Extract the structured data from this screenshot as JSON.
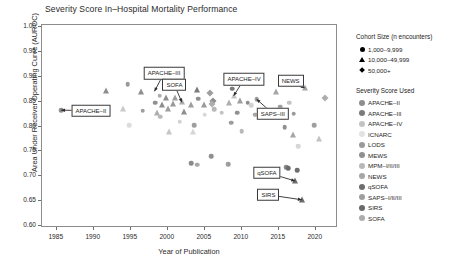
{
  "chart_data": {
    "type": "scatter",
    "title": "Severity Score In–Hospital Mortality Performance",
    "xlabel": "Year of Publication",
    "ylabel": "Area Under Receiver Operating Curve (AUROC)",
    "xlim": [
      1983,
      2023
    ],
    "ylim": [
      0.595,
      1.005
    ],
    "xticks": [
      1985,
      1990,
      1995,
      2000,
      2005,
      2010,
      2015,
      2020
    ],
    "yticks": [
      "1.00",
      "0.95",
      "0.90",
      "0.85",
      "0.80",
      "0.75",
      "0.70",
      "0.65",
      "0.60"
    ],
    "grid": false,
    "legend_position": "right",
    "size_legend": {
      "title": "Cohort Size (n encounters)",
      "entries": [
        {
          "shape": "circle",
          "label": "1,000–9,999"
        },
        {
          "shape": "triangle",
          "label": "10,000–49,999"
        },
        {
          "shape": "diamond",
          "label": "50,000+"
        }
      ]
    },
    "color_legend": {
      "title": "Severity Score Used",
      "entries": [
        {
          "label": "APACHE–II",
          "color": "#8e8e8e"
        },
        {
          "label": "APACHE–III",
          "color": "#7b7b7b"
        },
        {
          "label": "APACHE–IV",
          "color": "#c3c3c3"
        },
        {
          "label": "ICNARC",
          "color": "#e2e2e2"
        },
        {
          "label": "LODS",
          "color": "#9a9a9a"
        },
        {
          "label": "MEWS",
          "color": "#909090"
        },
        {
          "label": "MPM–I/II/III",
          "color": "#b8b8b8"
        },
        {
          "label": "NEWS",
          "color": "#a6a6a6"
        },
        {
          "label": "qSOFA",
          "color": "#6d6d6d"
        },
        {
          "label": "SAPS–I/II/III",
          "color": "#9e9e9e"
        },
        {
          "label": "SIRS",
          "color": "#6a6a6a"
        },
        {
          "label": "SOFA",
          "color": "#adadad"
        }
      ]
    },
    "annotations": [
      {
        "label": "APACHE–II",
        "box_x": 1989.6,
        "box_y": 0.832,
        "tip_x": 1985.6,
        "tip_y": 0.833
      },
      {
        "label": "APACHE–III",
        "box_x": 1999.5,
        "box_y": 0.908,
        "tip_x": 1998.2,
        "tip_y": 0.871
      },
      {
        "label": "APACHE–IV",
        "box_x": 2010.3,
        "box_y": 0.895,
        "tip_x": 2008.9,
        "tip_y": 0.862
      },
      {
        "label": "SOFA",
        "box_x": 2000.9,
        "box_y": 0.884,
        "tip_x": 2001.9,
        "tip_y": 0.849
      },
      {
        "label": "NEWS",
        "box_x": 2016.6,
        "box_y": 0.892,
        "tip_x": 2018.5,
        "tip_y": 0.878
      },
      {
        "label": "SAPS–III",
        "box_x": 2014.2,
        "box_y": 0.826,
        "tip_x": 2012.0,
        "tip_y": 0.855
      },
      {
        "label": "qSOFA",
        "box_x": 2013.4,
        "box_y": 0.707,
        "tip_x": 2017.2,
        "tip_y": 0.69
      },
      {
        "label": "SIRS",
        "box_x": 2013.6,
        "box_y": 0.662,
        "tip_x": 2018.1,
        "tip_y": 0.652
      }
    ],
    "points": [
      {
        "x": 1985.6,
        "y": 0.833,
        "score": "APACHE–II",
        "shape": "circle",
        "color": "#8e8e8e"
      },
      {
        "x": 1991.6,
        "y": 0.872,
        "score": "APACHE–II",
        "shape": "triangle",
        "color": "#8e8e8e"
      },
      {
        "x": 1994.6,
        "y": 0.885,
        "score": "APACHE–II",
        "shape": "circle",
        "color": "#9a9a9a"
      },
      {
        "x": 1996.4,
        "y": 0.869,
        "score": "APACHE–II",
        "shape": "triangle",
        "color": "#8e8e8e"
      },
      {
        "x": 1994.0,
        "y": 0.836,
        "score": "MPM–I/II/III",
        "shape": "triangle",
        "color": "#cacaca"
      },
      {
        "x": 1996.6,
        "y": 0.832,
        "score": "SAPS–I/II/III",
        "shape": "circle",
        "color": "#9e9e9e"
      },
      {
        "x": 1994.8,
        "y": 0.803,
        "score": "ICNARC",
        "shape": "circle",
        "color": "#dcdcdc"
      },
      {
        "x": 2000.2,
        "y": 0.878,
        "score": "APACHE–III",
        "shape": "triangle",
        "color": "#7b7b7b"
      },
      {
        "x": 1998.9,
        "y": 0.862,
        "score": "SOFA",
        "shape": "circle",
        "color": "#adadad"
      },
      {
        "x": 1999.8,
        "y": 0.857,
        "score": "APACHE–II",
        "shape": "triangle",
        "color": "#8e8e8e"
      },
      {
        "x": 2001.0,
        "y": 0.858,
        "score": "SAPS–I/II/III",
        "shape": "triangle",
        "color": "#9e9e9e"
      },
      {
        "x": 2001.9,
        "y": 0.849,
        "score": "SOFA",
        "shape": "triangle",
        "color": "#adadad"
      },
      {
        "x": 2000.7,
        "y": 0.846,
        "score": "LODS",
        "shape": "triangle",
        "color": "#9a9a9a"
      },
      {
        "x": 1999.2,
        "y": 0.843,
        "score": "APACHE–II",
        "shape": "triangle",
        "color": "#8e8e8e"
      },
      {
        "x": 1998.3,
        "y": 0.848,
        "score": "MEWS",
        "shape": "circle",
        "color": "#909090"
      },
      {
        "x": 2000.0,
        "y": 0.836,
        "score": "SAPS–I/II/III",
        "shape": "triangle",
        "color": "#9e9e9e"
      },
      {
        "x": 1998.6,
        "y": 0.828,
        "score": "SOFA",
        "shape": "triangle",
        "color": "#adadad"
      },
      {
        "x": 2002.2,
        "y": 0.83,
        "score": "APACHE–II",
        "shape": "triangle",
        "color": "#8e8e8e"
      },
      {
        "x": 1999.0,
        "y": 0.82,
        "score": "MPM–I/II/III",
        "shape": "circle",
        "color": "#b8b8b8"
      },
      {
        "x": 2001.6,
        "y": 0.81,
        "score": "ICNARC",
        "shape": "circle",
        "color": "#d2d2d2"
      },
      {
        "x": 2000.1,
        "y": 0.789,
        "score": "MPM–I/II/III",
        "shape": "triangle",
        "color": "#c6c6c6"
      },
      {
        "x": 2003.4,
        "y": 0.788,
        "score": "ICNARC",
        "shape": "triangle",
        "color": "#d6d6d6"
      },
      {
        "x": 2004.0,
        "y": 0.873,
        "score": "APACHE–III",
        "shape": "triangle",
        "color": "#7b7b7b"
      },
      {
        "x": 2005.7,
        "y": 0.867,
        "score": "SAPS–I/II/III",
        "shape": "diamond",
        "color": "#9e9e9e"
      },
      {
        "x": 2006.1,
        "y": 0.852,
        "score": "APACHE–II",
        "shape": "diamond",
        "color": "#8e8e8e"
      },
      {
        "x": 2006.0,
        "y": 0.845,
        "score": "SOFA",
        "shape": "diamond",
        "color": "#adadad"
      },
      {
        "x": 2004.1,
        "y": 0.856,
        "score": "MEWS",
        "shape": "circle",
        "color": "#909090"
      },
      {
        "x": 2004.9,
        "y": 0.843,
        "score": "LODS",
        "shape": "triangle",
        "color": "#9a9a9a"
      },
      {
        "x": 2006.3,
        "y": 0.835,
        "score": "MPM–I/II/III",
        "shape": "circle",
        "color": "#b8b8b8"
      },
      {
        "x": 2003.1,
        "y": 0.843,
        "score": "SAPS–I/II/III",
        "shape": "triangle",
        "color": "#9e9e9e"
      },
      {
        "x": 2005.0,
        "y": 0.824,
        "score": "ICNARC",
        "shape": "circle",
        "color": "#d8d8d8"
      },
      {
        "x": 2003.6,
        "y": 0.803,
        "score": "MEWS",
        "shape": "circle",
        "color": "#9d9d9d"
      },
      {
        "x": 2007.3,
        "y": 0.828,
        "score": "APACHE–IV",
        "shape": "circle",
        "color": "#c3c3c3"
      },
      {
        "x": 2008.9,
        "y": 0.862,
        "score": "APACHE–IV",
        "shape": "triangle",
        "color": "#c3c3c3"
      },
      {
        "x": 2008.7,
        "y": 0.876,
        "score": "APACHE–III",
        "shape": "circle",
        "color": "#7b7b7b"
      },
      {
        "x": 2009.8,
        "y": 0.852,
        "score": "SAPS–I/II/III",
        "shape": "triangle",
        "color": "#9e9e9e"
      },
      {
        "x": 2008.3,
        "y": 0.847,
        "score": "SOFA",
        "shape": "triangle",
        "color": "#adadad"
      },
      {
        "x": 2010.8,
        "y": 0.848,
        "score": "APACHE–II",
        "shape": "circle",
        "color": "#8e8e8e"
      },
      {
        "x": 2012.0,
        "y": 0.855,
        "score": "SAPS–I/II/III",
        "shape": "circle",
        "color": "#9e9e9e"
      },
      {
        "x": 2011.3,
        "y": 0.843,
        "score": "ICNARC",
        "shape": "circle",
        "color": "#d0d0d0"
      },
      {
        "x": 2009.4,
        "y": 0.828,
        "score": "MEWS",
        "shape": "circle",
        "color": "#909090"
      },
      {
        "x": 2011.8,
        "y": 0.824,
        "score": "NEWS",
        "shape": "circle",
        "color": "#a6a6a6"
      },
      {
        "x": 2008.6,
        "y": 0.808,
        "score": "MEWS",
        "shape": "circle",
        "color": "#9d9d9d"
      },
      {
        "x": 2010.0,
        "y": 0.79,
        "score": "MPM–I/II/III",
        "shape": "circle",
        "color": "#b8b8b8"
      },
      {
        "x": 2014.6,
        "y": 0.87,
        "score": "NEWS",
        "shape": "triangle",
        "color": "#a6a6a6"
      },
      {
        "x": 2016.4,
        "y": 0.848,
        "score": "APACHE–IV",
        "shape": "circle",
        "color": "#c3c3c3"
      },
      {
        "x": 2015.2,
        "y": 0.84,
        "score": "SAPS–I/II/III",
        "shape": "circle",
        "color": "#9e9e9e"
      },
      {
        "x": 2013.9,
        "y": 0.821,
        "score": "SOFA",
        "shape": "circle",
        "color": "#adadad"
      },
      {
        "x": 2017.0,
        "y": 0.826,
        "score": "LODS",
        "shape": "circle",
        "color": "#9a9a9a"
      },
      {
        "x": 2015.8,
        "y": 0.798,
        "score": "MEWS",
        "shape": "circle",
        "color": "#909090"
      },
      {
        "x": 2016.9,
        "y": 0.782,
        "score": "NEWS",
        "shape": "triangle",
        "color": "#a6a6a6"
      },
      {
        "x": 2018.5,
        "y": 0.878,
        "score": "NEWS",
        "shape": "triangle",
        "color": "#a6a6a6"
      },
      {
        "x": 2021.2,
        "y": 0.858,
        "score": "SOFA",
        "shape": "diamond",
        "color": "#adadad"
      },
      {
        "x": 2019.8,
        "y": 0.803,
        "score": "SAPS–I/II/III",
        "shape": "circle",
        "color": "#9e9e9e"
      },
      {
        "x": 2020.4,
        "y": 0.774,
        "score": "APACHE–IV",
        "shape": "triangle",
        "color": "#c3c3c3"
      },
      {
        "x": 2017.6,
        "y": 0.76,
        "score": "ICNARC",
        "shape": "circle",
        "color": "#d6d6d6"
      },
      {
        "x": 2016.0,
        "y": 0.718,
        "score": "qSOFA",
        "shape": "circle",
        "color": "#8a8a8a"
      },
      {
        "x": 2016.3,
        "y": 0.716,
        "score": "qSOFA",
        "shape": "circle",
        "color": "#6d6d6d"
      },
      {
        "x": 2017.2,
        "y": 0.69,
        "score": "qSOFA",
        "shape": "triangle",
        "color": "#6d6d6d"
      },
      {
        "x": 2017.5,
        "y": 0.712,
        "score": "qSOFA",
        "shape": "circle",
        "color": "#6d6d6d"
      },
      {
        "x": 2018.1,
        "y": 0.652,
        "score": "SIRS",
        "shape": "triangle",
        "color": "#6a6a6a"
      },
      {
        "x": 2008.2,
        "y": 0.724,
        "score": "MEWS",
        "shape": "circle",
        "color": "#9d9d9d"
      },
      {
        "x": 2005.9,
        "y": 0.74,
        "score": "SIRS",
        "shape": "circle",
        "color": "#8f8f8f"
      },
      {
        "x": 2003.2,
        "y": 0.726,
        "score": "SIRS",
        "shape": "circle",
        "color": "#8a8a8a"
      },
      {
        "x": 2004.0,
        "y": 0.723,
        "score": "SIRS",
        "shape": "circle",
        "color": "#a8a8a8"
      }
    ]
  }
}
